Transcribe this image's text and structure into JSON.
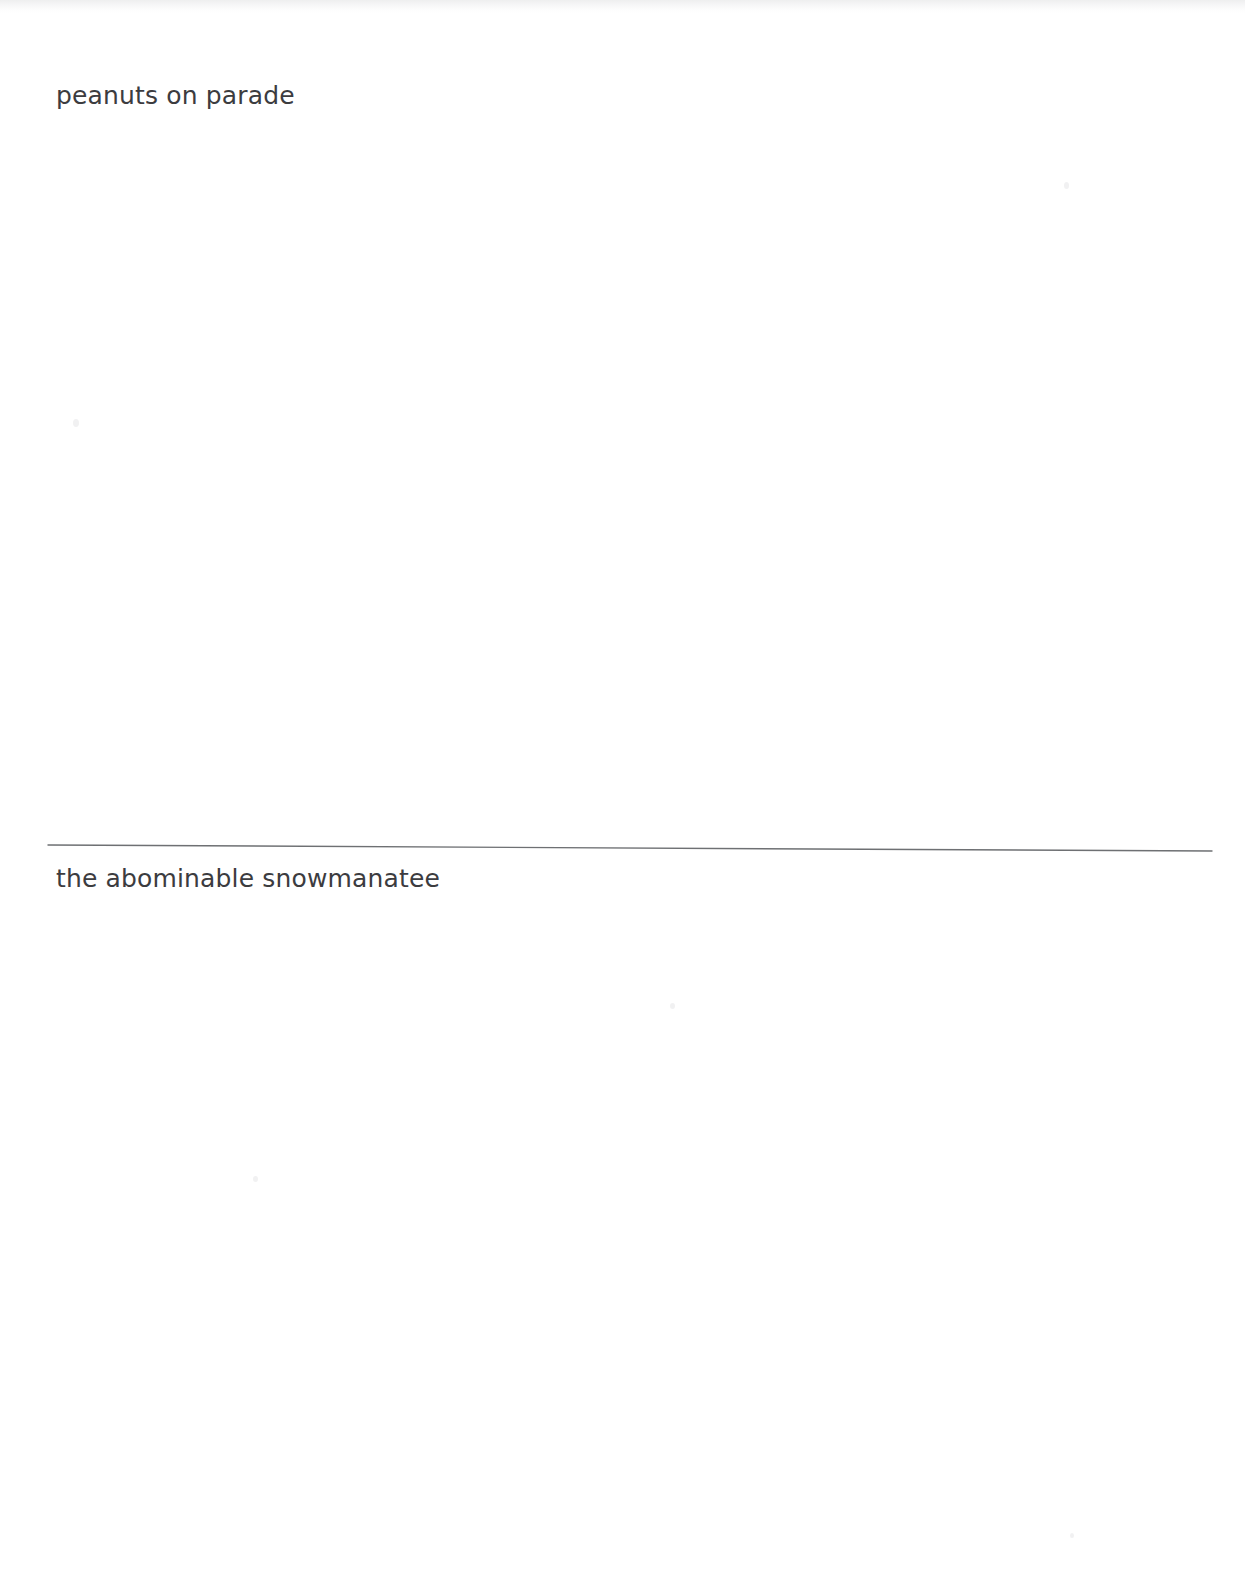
{
  "document": {
    "type": "scanned-page",
    "page_width": 1245,
    "page_height": 1579,
    "background_color": "#ffffff",
    "ink_color": "#3c3c3f",
    "rule_color": "#6e7073"
  },
  "content": {
    "top_entry": {
      "text": "peanuts on parade"
    },
    "divider": {
      "label": "horizontal-rule",
      "start_x": 48,
      "start_y": 845,
      "end_x": 1212,
      "end_y": 851,
      "stroke_width": 1.4,
      "color": "#6e7073"
    },
    "bottom_entry": {
      "text": "the abominable snowmanatee"
    }
  },
  "artifacts": {
    "top_edge_shadow": "scanner-edge-shadow",
    "specks": [
      "speck-1",
      "speck-2",
      "speck-3",
      "speck-4",
      "speck-5"
    ]
  }
}
